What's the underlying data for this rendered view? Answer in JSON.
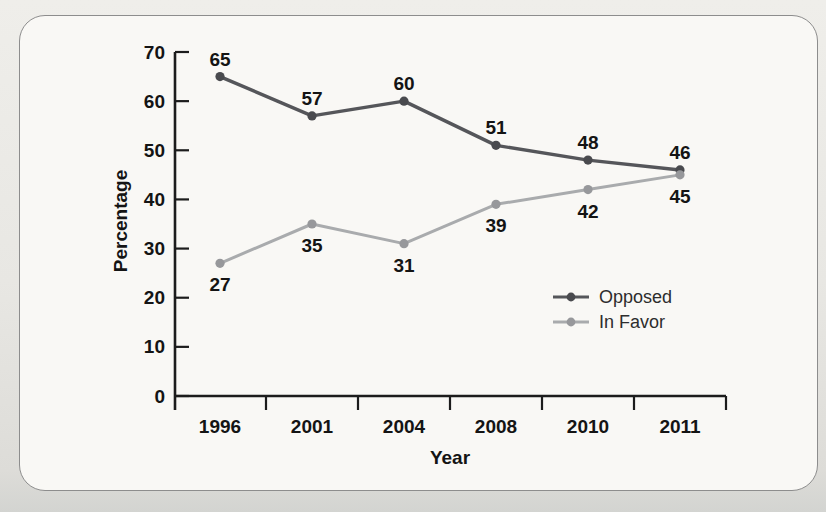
{
  "page": {
    "background_color": "#e8e7e3",
    "panel_background": "#f9f8f5",
    "panel_border_color": "#8d8d8d"
  },
  "chart_data": {
    "type": "line",
    "categories": [
      "1996",
      "2001",
      "2004",
      "2008",
      "2010",
      "2011"
    ],
    "series": [
      {
        "name": "Opposed",
        "values": [
          65,
          57,
          60,
          51,
          48,
          46
        ],
        "color": "#55565a",
        "marker_color": "#494a4e",
        "label_position": "above"
      },
      {
        "name": "In Favor",
        "values": [
          27,
          35,
          31,
          39,
          42,
          45
        ],
        "color": "#a9abad",
        "marker_color": "#97989b",
        "label_position": "below"
      }
    ],
    "xlabel": "Year",
    "ylabel": "Percentage",
    "ylim": [
      0,
      70
    ],
    "ytick_step": 10,
    "ytick_labels": [
      "0",
      "10",
      "20",
      "30",
      "40",
      "50",
      "60",
      "70"
    ],
    "grid": false,
    "legend_position": "inside-right-middle",
    "axis_color": "#1c1c1c",
    "label_color": "#141414",
    "legend_text_color": "#2d2d2d"
  }
}
